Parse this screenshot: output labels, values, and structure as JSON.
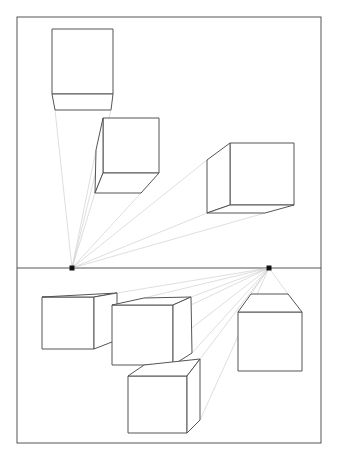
{
  "drawing": {
    "title": "Two-point perspective boxes drawing",
    "frame": {
      "x": 17,
      "y": 17,
      "w": 304,
      "h": 426
    },
    "horizon": {
      "y": 268,
      "x1": 17,
      "x2": 321
    },
    "colors": {
      "line": "#555555",
      "guide": "#c8c8c8",
      "vanishing_point": "#111111",
      "background": "#ffffff"
    },
    "vanishing_points": [
      {
        "name": "left-vanishing-point",
        "x": 72,
        "y": 268
      },
      {
        "name": "right-vanishing-point",
        "x": 269,
        "y": 268
      }
    ],
    "boxes": [
      {
        "name": "box-top-left",
        "vp": 0,
        "faces": [
          [
            [
              52,
              29
            ],
            [
              113,
              29
            ],
            [
              113,
              94
            ],
            [
              52,
              94
            ]
          ],
          [
            [
              52,
              94
            ],
            [
              113,
              94
            ],
            [
              111,
              110
            ],
            [
              55,
              110
            ]
          ]
        ]
      },
      {
        "name": "box-top-middle",
        "vp": 0,
        "faces": [
          [
            [
              103,
              118
            ],
            [
              159,
              118
            ],
            [
              159,
              173
            ],
            [
              103,
              173
            ]
          ],
          [
            [
              103,
              118
            ],
            [
              103,
              173
            ],
            [
              95,
              193
            ],
            [
              96,
              150
            ]
          ],
          [
            [
              103,
              173
            ],
            [
              159,
              173
            ],
            [
              141,
              193
            ],
            [
              95,
              193
            ]
          ]
        ]
      },
      {
        "name": "box-top-right",
        "vp": 0,
        "faces": [
          [
            [
              230,
              143
            ],
            [
              294,
              143
            ],
            [
              294,
              205
            ],
            [
              230,
              205
            ]
          ],
          [
            [
              230,
              143
            ],
            [
              230,
              205
            ],
            [
              207,
              213
            ],
            [
              207,
              160
            ]
          ],
          [
            [
              230,
              205
            ],
            [
              294,
              205
            ],
            [
              265,
              213
            ],
            [
              207,
              213
            ]
          ]
        ]
      },
      {
        "name": "box-bottom-left",
        "vp": 1,
        "faces": [
          [
            [
              42,
              297
            ],
            [
              94,
              297
            ],
            [
              94,
              349
            ],
            [
              42,
              349
            ]
          ],
          [
            [
              42,
              297
            ],
            [
              117,
              293
            ],
            [
              94,
              297
            ]
          ],
          [
            [
              94,
              297
            ],
            [
              117,
              293
            ],
            [
              117,
              340
            ],
            [
              94,
              349
            ]
          ]
        ]
      },
      {
        "name": "box-bottom-middle",
        "vp": 1,
        "faces": [
          [
            [
              112,
              305
            ],
            [
              173,
              305
            ],
            [
              173,
              365
            ],
            [
              112,
              365
            ]
          ],
          [
            [
              112,
              305
            ],
            [
              144,
              298
            ],
            [
              191,
              297
            ],
            [
              173,
              305
            ]
          ],
          [
            [
              173,
              305
            ],
            [
              191,
              297
            ],
            [
              192,
              353
            ],
            [
              173,
              365
            ]
          ]
        ]
      },
      {
        "name": "box-bottom-lower",
        "vp": 1,
        "faces": [
          [
            [
              128,
              376
            ],
            [
              187,
              376
            ],
            [
              187,
              433
            ],
            [
              128,
              433
            ]
          ],
          [
            [
              128,
              376
            ],
            [
              144,
              365
            ],
            [
              200,
              359
            ],
            [
              187,
              376
            ]
          ],
          [
            [
              187,
              376
            ],
            [
              200,
              359
            ],
            [
              200,
              420
            ],
            [
              187,
              433
            ]
          ]
        ]
      },
      {
        "name": "box-bottom-right",
        "vp": 1,
        "faces": [
          [
            [
              238,
              312
            ],
            [
              302,
              312
            ],
            [
              302,
              371
            ],
            [
              238,
              371
            ]
          ],
          [
            [
              238,
              312
            ],
            [
              251,
              294
            ],
            [
              288,
              294
            ],
            [
              302,
              312
            ]
          ]
        ]
      }
    ],
    "guides": [
      {
        "vp": 0,
        "to": [
          55,
          110
        ]
      },
      {
        "vp": 0,
        "to": [
          111,
          110
        ]
      },
      {
        "vp": 0,
        "to": [
          96,
          150
        ]
      },
      {
        "vp": 0,
        "to": [
          95,
          193
        ]
      },
      {
        "vp": 0,
        "to": [
          141,
          193
        ]
      },
      {
        "vp": 0,
        "to": [
          207,
          160
        ]
      },
      {
        "vp": 0,
        "to": [
          207,
          213
        ]
      },
      {
        "vp": 0,
        "to": [
          265,
          213
        ]
      },
      {
        "vp": 1,
        "to": [
          117,
          293
        ]
      },
      {
        "vp": 1,
        "to": [
          117,
          340
        ]
      },
      {
        "vp": 1,
        "to": [
          144,
          298
        ]
      },
      {
        "vp": 1,
        "to": [
          191,
          297
        ]
      },
      {
        "vp": 1,
        "to": [
          192,
          353
        ]
      },
      {
        "vp": 1,
        "to": [
          144,
          365
        ]
      },
      {
        "vp": 1,
        "to": [
          200,
          359
        ]
      },
      {
        "vp": 1,
        "to": [
          200,
          420
        ]
      },
      {
        "vp": 1,
        "to": [
          251,
          294
        ]
      },
      {
        "vp": 1,
        "to": [
          288,
          294
        ]
      }
    ]
  }
}
